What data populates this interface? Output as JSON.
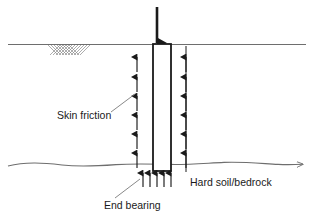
{
  "diagram": {
    "colors": {
      "ink": "#1a1a1a",
      "ground_line": "#6e6e6e",
      "bedrock_line": "#6e6e6e",
      "hatch": "#8a8a8a",
      "pile_outline": "#1a1a1a",
      "pile_fill": "#ffffff",
      "background": "#ffffff"
    },
    "labels": {
      "skin_friction": "Skin friction",
      "end_bearing": "End bearing",
      "hard_soil_bedrock": "Hard soil/bedrock"
    },
    "icons": {
      "applied_load": "down-arrow-icon",
      "skin_friction_left": "up-arrow-icon",
      "skin_friction_right": "up-arrow-icon",
      "end_bearing": "up-arrow-icon",
      "ground_hatch": "hatch-pattern-icon",
      "bedrock_boundary": "wavy-line-icon"
    },
    "geometry": {
      "ground_line_y": 44,
      "ground_line_x1": 8,
      "ground_line_x2": 306,
      "bedrock_line_y": 164,
      "bedrock_line_x1": 8,
      "bedrock_line_x2": 306,
      "pile_x": 153,
      "pile_y": 44,
      "pile_width": 18,
      "pile_height": 127,
      "hatch_x": 48,
      "hatch_y": 45,
      "hatch_width": 42,
      "hatch_height": 9,
      "load_arrow_x": 157,
      "load_arrow_y_top": 7,
      "load_arrow_y_bottom": 44
    },
    "arrows": {
      "skin_friction_left_count": 6,
      "skin_friction_right_count": 6,
      "end_bearing_count": 5,
      "skin_friction_left_x": 137,
      "skin_friction_right_x": 186,
      "skin_friction_y_positions": [
        62,
        82,
        101,
        120,
        139,
        158
      ],
      "end_bearing_y_top": 172,
      "end_bearing_y_bottom": 186,
      "end_bearing_x_positions": [
        143,
        150,
        157,
        164,
        171
      ]
    },
    "label_positions": {
      "skin_friction_x": 57,
      "skin_friction_y": 119,
      "end_bearing_x": 104,
      "end_bearing_y": 206,
      "hard_soil_bedrock_x": 190,
      "hard_soil_bedrock_y": 186
    },
    "leaders": {
      "skin_friction": {
        "x1": 111,
        "y1": 112,
        "x2": 135,
        "y2": 94
      },
      "end_bearing": {
        "x1": 115,
        "y1": 198,
        "x2": 139,
        "y2": 179
      }
    }
  }
}
